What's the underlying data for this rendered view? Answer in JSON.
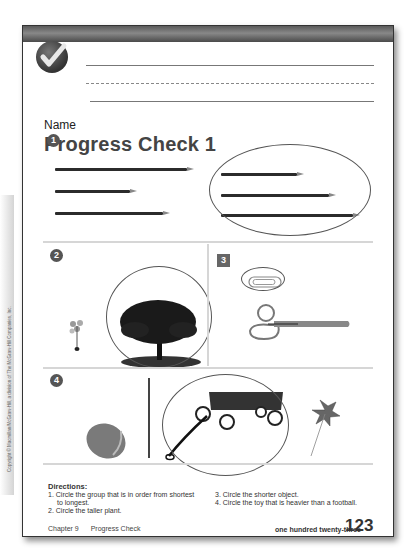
{
  "header": {
    "badge_icon": "checkmark-badge-icon",
    "name_label": "Name",
    "title": "Progress Check 1"
  },
  "sections": [
    {
      "number": "1",
      "badge_shape": "circle",
      "description": "Two groups of three pencils; right group (ordered shortest to longest) is circled"
    },
    {
      "number": "2",
      "badge_shape": "apple",
      "description": "Small sapling and large tree; large tree is circled"
    },
    {
      "number": "3",
      "badge_shape": "square",
      "description": "Paper clip and scissors; paper clip is circled"
    },
    {
      "number": "4",
      "badge_shape": "fish",
      "description": "Football, wagon and pinwheel; wagon is circled"
    }
  ],
  "directions": {
    "title": "Directions:",
    "items": [
      "1.  Circle the group that is in order from shortest",
      "to longest.",
      "2.  Circle the taller plant.",
      "3.  Circle the shorter object.",
      "4.  Circle the toy that is heavier than a football."
    ]
  },
  "footer": {
    "chapter": "Chapter 9",
    "section": "Progress Check",
    "page_words": "one hundred twenty-three",
    "page_number": "123"
  },
  "copyright": "Copyright © Macmillan/McGraw-Hill, a division of The McGraw-Hill Companies, Inc.",
  "colors": {
    "band": "#6a6a6a",
    "border": "#333333",
    "rule": "#d6d6d6",
    "circle_stroke": "#555555"
  }
}
